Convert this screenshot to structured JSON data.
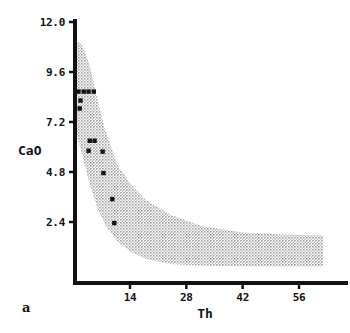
{
  "chart_data": {
    "type": "scatter",
    "title": "",
    "panel_label": "a",
    "xlabel": "Th",
    "ylabel": "CaO",
    "xlim": [
      0,
      66
    ],
    "ylim": [
      0,
      12.0
    ],
    "grid": false,
    "legend": null,
    "xticks": [
      14,
      28,
      42,
      56
    ],
    "xtick_labels": [
      "14",
      "28",
      "42",
      "56"
    ],
    "yticks": [
      2.4,
      4.8,
      7.2,
      9.6,
      12.0
    ],
    "ytick_labels": [
      "2.4",
      "4.8",
      "7.2",
      "9.6",
      "12.0"
    ],
    "series": [
      {
        "name": "samples",
        "marker": "filled-square",
        "color": "#111111",
        "points": [
          {
            "x": 1.2,
            "y": 8.66
          },
          {
            "x": 2.5,
            "y": 8.66
          },
          {
            "x": 3.7,
            "y": 8.66
          },
          {
            "x": 5.0,
            "y": 8.66
          },
          {
            "x": 1.7,
            "y": 8.23
          },
          {
            "x": 1.5,
            "y": 7.85
          },
          {
            "x": 4.0,
            "y": 6.3
          },
          {
            "x": 5.2,
            "y": 6.3
          },
          {
            "x": 3.7,
            "y": 5.82
          },
          {
            "x": 7.2,
            "y": 5.78
          },
          {
            "x": 7.4,
            "y": 4.75
          },
          {
            "x": 9.6,
            "y": 3.5
          },
          {
            "x": 10.1,
            "y": 2.35
          }
        ]
      }
    ],
    "band": {
      "name": "shaded envelope",
      "fill": "#c9c9c9",
      "pattern": "stipple",
      "upper": [
        {
          "x": 0.4,
          "y": 11.1
        },
        {
          "x": 2.0,
          "y": 10.95
        },
        {
          "x": 4.0,
          "y": 9.9
        },
        {
          "x": 6.0,
          "y": 8.2
        },
        {
          "x": 8.0,
          "y": 6.7
        },
        {
          "x": 11.0,
          "y": 5.1
        },
        {
          "x": 14.0,
          "y": 4.25
        },
        {
          "x": 18.0,
          "y": 3.45
        },
        {
          "x": 24.0,
          "y": 2.75
        },
        {
          "x": 32.0,
          "y": 2.2
        },
        {
          "x": 42.0,
          "y": 1.9
        },
        {
          "x": 52.0,
          "y": 1.8
        },
        {
          "x": 62.0,
          "y": 1.75
        }
      ],
      "lower": [
        {
          "x": 0.4,
          "y": 6.9
        },
        {
          "x": 2.0,
          "y": 5.7
        },
        {
          "x": 4.0,
          "y": 4.2
        },
        {
          "x": 6.0,
          "y": 3.05
        },
        {
          "x": 8.0,
          "y": 2.2
        },
        {
          "x": 11.0,
          "y": 1.45
        },
        {
          "x": 14.0,
          "y": 1.0
        },
        {
          "x": 18.0,
          "y": 0.62
        },
        {
          "x": 24.0,
          "y": 0.38
        },
        {
          "x": 32.0,
          "y": 0.3
        },
        {
          "x": 42.0,
          "y": 0.28
        },
        {
          "x": 52.0,
          "y": 0.27
        },
        {
          "x": 62.0,
          "y": 0.26
        }
      ]
    }
  },
  "axes": {
    "x_title": "Th",
    "y_title": "CaO",
    "panel": "a"
  }
}
